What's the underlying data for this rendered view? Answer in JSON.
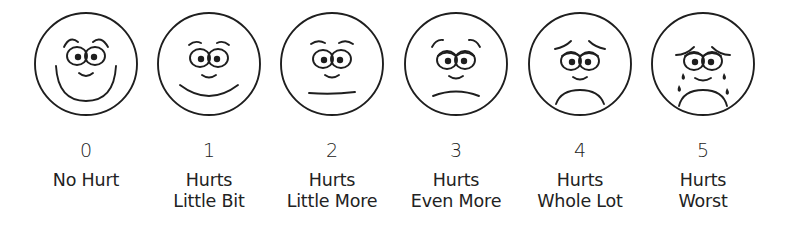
{
  "faces": [
    {
      "rating": "0",
      "line1": "No Hurt",
      "line2": "",
      "expression": "very-happy-face-icon",
      "center_x": 86
    },
    {
      "rating": "1",
      "line1": "Hurts",
      "line2": "Little Bit",
      "expression": "happy-face-icon",
      "center_x": 209
    },
    {
      "rating": "2",
      "line1": "Hurts",
      "line2": "Little More",
      "expression": "neutral-face-icon",
      "center_x": 332
    },
    {
      "rating": "3",
      "line1": "Hurts",
      "line2": "Even More",
      "expression": "slightly-sad-face-icon",
      "center_x": 456
    },
    {
      "rating": "4",
      "line1": "Hurts",
      "line2": "Whole Lot",
      "expression": "sad-face-icon",
      "center_x": 580
    },
    {
      "rating": "5",
      "line1": "Hurts",
      "line2": "Worst",
      "expression": "crying-face-icon",
      "center_x": 703
    }
  ],
  "colors": {
    "line": "#1e1e1e",
    "background": "#ffffff"
  }
}
